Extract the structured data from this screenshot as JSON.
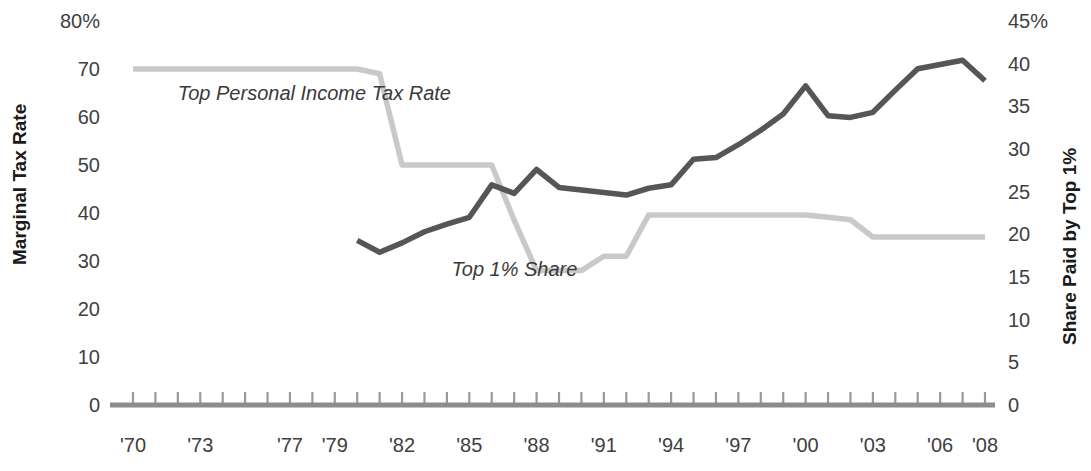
{
  "chart_data": {
    "type": "line",
    "title": "",
    "xlabel": "",
    "ylabel": "Marginal Tax Rate",
    "y2label": "Share Paid by Top 1%",
    "grid": false,
    "legend_position": "inline-annotations",
    "x": [
      1970,
      1971,
      1972,
      1973,
      1974,
      1975,
      1976,
      1977,
      1978,
      1979,
      1980,
      1981,
      1982,
      1983,
      1984,
      1985,
      1986,
      1987,
      1988,
      1989,
      1990,
      1991,
      1992,
      1993,
      1994,
      1995,
      1996,
      1997,
      1998,
      1999,
      2000,
      2001,
      2002,
      2003,
      2004,
      2005,
      2006,
      2007,
      2008
    ],
    "x_tick_labels": [
      "'70",
      "'73",
      "'77",
      "'79",
      "'82",
      "'85",
      "'88",
      "'91",
      "'94",
      "'97",
      "'00",
      "'03",
      "'06",
      "'08"
    ],
    "x_tick_years": [
      1970,
      1973,
      1977,
      1979,
      1982,
      1985,
      1988,
      1991,
      1994,
      1997,
      2000,
      2003,
      2006,
      2008
    ],
    "ylim": [
      0,
      80
    ],
    "y_tick_labels": [
      "80%",
      "70",
      "60",
      "50",
      "40",
      "30",
      "20",
      "10",
      "0"
    ],
    "y_ticks": [
      80,
      70,
      60,
      50,
      40,
      30,
      20,
      10,
      0
    ],
    "y2lim": [
      0,
      45
    ],
    "y2_tick_labels": [
      "45%",
      "40",
      "35",
      "30",
      "25",
      "20",
      "15",
      "10",
      "5",
      "0"
    ],
    "y2_ticks": [
      45,
      40,
      35,
      30,
      25,
      20,
      15,
      10,
      5,
      0
    ],
    "series": [
      {
        "name": "Top Personal Income Tax Rate",
        "axis": "left",
        "color": "#c9c9c9",
        "label_text": "Top Personal Income Tax Rate",
        "values": [
          70,
          70,
          70,
          70,
          70,
          70,
          70,
          70,
          70,
          70,
          70,
          69,
          50,
          50,
          50,
          50,
          50,
          38.5,
          28,
          28,
          28,
          31,
          31,
          39.6,
          39.6,
          39.6,
          39.6,
          39.6,
          39.6,
          39.6,
          39.6,
          39.1,
          38.6,
          35,
          35,
          35,
          35,
          35,
          35
        ]
      },
      {
        "name": "Top 1% Share",
        "axis": "right",
        "color": "#565656",
        "label_text": "Top 1% Share",
        "values": [
          null,
          null,
          null,
          null,
          null,
          null,
          null,
          null,
          null,
          null,
          19.3,
          17.9,
          19.0,
          20.3,
          21.2,
          22.0,
          25.8,
          24.8,
          27.6,
          25.5,
          25.2,
          24.9,
          24.6,
          25.4,
          25.8,
          28.8,
          29.0,
          30.5,
          32.2,
          34.1,
          37.4,
          33.9,
          33.7,
          34.3,
          36.9,
          39.4,
          39.9,
          40.4,
          38.0
        ]
      }
    ],
    "annotations": [
      {
        "text": "Top Personal Income Tax Rate",
        "x": 1972.0,
        "y_left": 63.5
      },
      {
        "text": "Top 1% Share",
        "x": 1984.2,
        "y_right": 15.1
      }
    ]
  },
  "axes": {
    "left_title": "Marginal Tax Rate",
    "right_title": "Share Paid by Top 1%"
  }
}
